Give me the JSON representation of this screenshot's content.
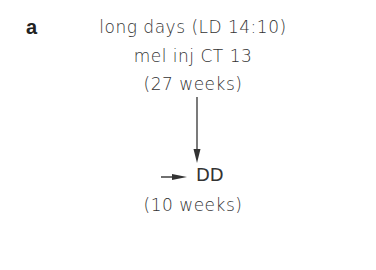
{
  "panel_label": "a",
  "nodes": {
    "start": {
      "line1": "long days (LD 14:10)",
      "line2": "mel inj CT 13",
      "line3": "(27 weeks)"
    },
    "end": {
      "label": "DD",
      "duration": "(10 weeks)"
    }
  },
  "edges": [
    {
      "from": "start",
      "to": "end",
      "type": "arrow-down"
    }
  ],
  "markers": [
    {
      "type": "arrow-pointing-right",
      "target": "end"
    }
  ]
}
